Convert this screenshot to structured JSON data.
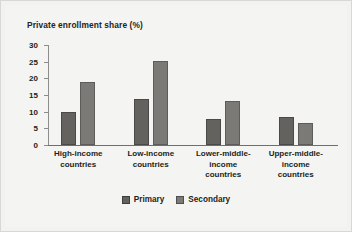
{
  "figure": {
    "background_color": "#f2f2f0",
    "border_color": "#d8d8d5"
  },
  "chart_data": {
    "type": "bar",
    "title": "Private enrollment share (%)",
    "xlabel": "",
    "ylabel": "",
    "ylim": [
      0,
      30
    ],
    "yticks": [
      0,
      5,
      10,
      15,
      20,
      25,
      30
    ],
    "ytick_labels": [
      "0",
      "5",
      "10",
      "15",
      "20",
      "25",
      "30"
    ],
    "grid": false,
    "legend_position": "bottom-center",
    "categories": [
      "High-income countries",
      "Low-income countries",
      "Lower-middle-income countries",
      "Upper-middle-income countries"
    ],
    "category_lines": [
      [
        "High-income",
        "countries"
      ],
      [
        "Low-income",
        "countries"
      ],
      [
        "Lower-middle-",
        "income",
        "countries"
      ],
      [
        "Upper-middle-",
        "income",
        "countries"
      ]
    ],
    "series": [
      {
        "name": "Primary",
        "color": "#63625f",
        "values": [
          10.0,
          13.7,
          7.9,
          8.4
        ]
      },
      {
        "name": "Secondary",
        "color": "#7b7a77",
        "values": [
          19.0,
          25.1,
          13.2,
          6.5
        ]
      }
    ]
  },
  "legend": {
    "items": [
      {
        "label": "Primary",
        "color": "#63625f"
      },
      {
        "label": "Secondary",
        "color": "#7b7a77"
      }
    ]
  }
}
